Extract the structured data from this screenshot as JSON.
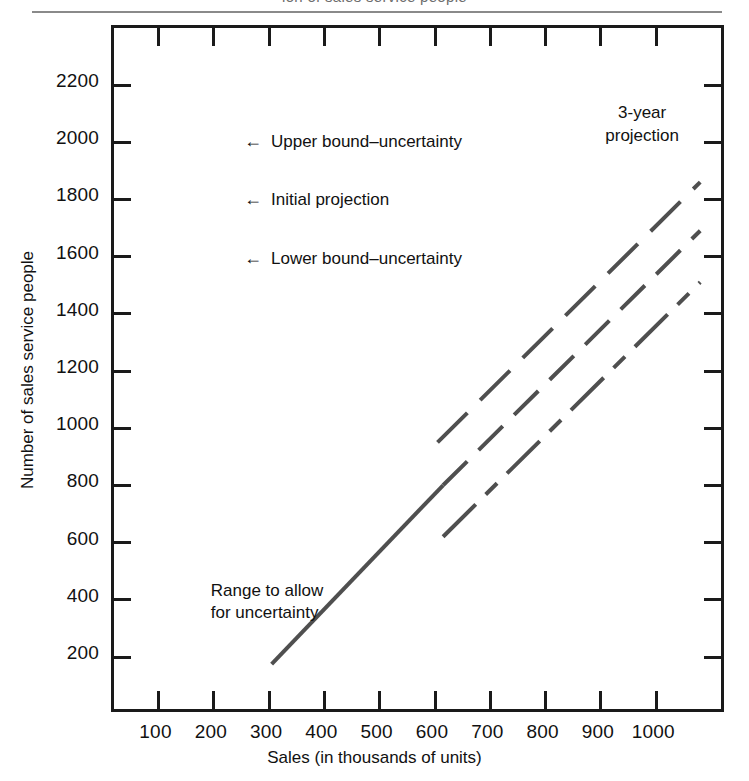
{
  "page": {
    "cropped_header_text": "ion of sales service people",
    "figure_background": "#ffffff",
    "line_color": "#4f4f4f",
    "axis_color": "#1a1a1a"
  },
  "chart_data": {
    "type": "line",
    "title": "",
    "xlabel": "Sales (in thousands of units)",
    "ylabel": "Number of sales service people",
    "xlim": [
      0,
      1100
    ],
    "ylim": [
      0,
      2300
    ],
    "xticks": [
      100,
      200,
      300,
      400,
      500,
      600,
      700,
      800,
      900,
      1000
    ],
    "yticks": [
      200,
      400,
      600,
      800,
      1000,
      1200,
      1400,
      1600,
      1800,
      2000,
      2200
    ],
    "xtick_labels": [
      "100",
      "200",
      "300",
      "400",
      "500",
      "600",
      "700",
      "800",
      "900",
      "1000"
    ],
    "ytick_labels": [
      "200",
      "400",
      "600",
      "800",
      "1000",
      "1200",
      "1400",
      "1600",
      "1800",
      "2000",
      "2200"
    ],
    "grid": false,
    "legend": "none",
    "series": [
      {
        "name": "Historical trend",
        "style": "solid",
        "x": [
          310,
          620
        ],
        "values": [
          165,
          790
        ]
      },
      {
        "name": "Upper bound-uncertainty",
        "style": "long-dashed",
        "x": [
          610,
          1085
        ],
        "values": [
          940,
          1850
        ]
      },
      {
        "name": "Initial projection",
        "style": "dashed",
        "x": [
          620,
          1085
        ],
        "values": [
          790,
          1680
        ]
      },
      {
        "name": "Lower bound-uncertainty",
        "style": "dash-dot",
        "x": [
          620,
          1085
        ],
        "values": [
          610,
          1500
        ]
      }
    ],
    "annotations": [
      {
        "name": "upper-bound-annotation",
        "text": "Upper bound–uncertainty",
        "arrow": "←",
        "x": 260,
        "y": 1995
      },
      {
        "name": "initial-projection-annotation",
        "text": "Initial projection",
        "arrow": "←",
        "x": 260,
        "y": 1790
      },
      {
        "name": "lower-bound-annotation",
        "text": "Lower bound–uncertainty",
        "arrow": "←",
        "x": 260,
        "y": 1585
      },
      {
        "name": "range-annotation",
        "line1": "Range to allow",
        "line2": "for uncertainty",
        "x": 200,
        "y": 420
      },
      {
        "name": "three-year-projection-annotation",
        "line1": "3-year",
        "line2": "projection",
        "x": 980,
        "y": 2090
      }
    ]
  },
  "axis": {
    "y_title": "Number of sales service people",
    "x_title": "Sales (in thousands of units)"
  },
  "annotations": {
    "upper_bound": "Upper bound–uncertainty",
    "initial_projection": "Initial projection",
    "lower_bound": "Lower bound–uncertainty",
    "range_line1": "Range to allow",
    "range_line2": "for uncertainty",
    "projection_line1": "3-year",
    "projection_line2": "projection",
    "arrow_glyph": "←"
  }
}
